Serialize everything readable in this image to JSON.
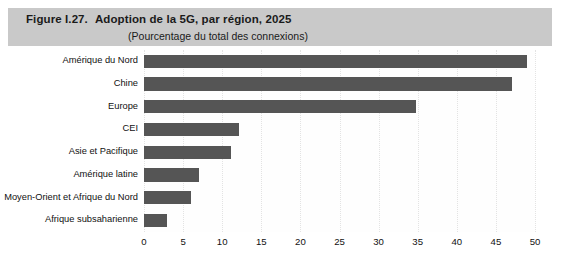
{
  "header": {
    "figure_number": "Figure I.27.",
    "title": "Adoption de la 5G, par région, 2025",
    "subtitle": "(Pourcentage du total des connexions)",
    "band_color": "#c9c9c9"
  },
  "chart_data": {
    "type": "bar",
    "orientation": "horizontal",
    "title": "Adoption de la 5G, par région, 2025",
    "subtitle": "(Pourcentage du total des connexions)",
    "xlabel": "",
    "ylabel": "",
    "categories": [
      "Amérique du Nord",
      "Chine",
      "Europe",
      "CEI",
      "Asie et Pacifique",
      "Amérique latine",
      "Moyen-Orient et Afrique du Nord",
      "Afrique subsaharienne"
    ],
    "values": [
      49,
      47,
      34.8,
      12.2,
      11.1,
      7,
      6,
      3
    ],
    "xlim": [
      0,
      50
    ],
    "xticks": [
      0,
      5,
      10,
      15,
      20,
      25,
      30,
      35,
      40,
      45,
      50
    ],
    "xtick_labels": [
      "0",
      "5",
      "10",
      "15",
      "20",
      "25",
      "30",
      "35",
      "40",
      "45",
      "50"
    ],
    "grid": "vertical-dotted",
    "legend": null,
    "bar_color": "#555555",
    "background_color": "#ffffff"
  }
}
